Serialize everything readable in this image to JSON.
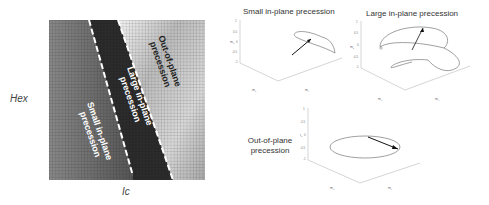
{
  "phase_diagram": {
    "y_axis_label": "Hex",
    "x_axis_label": "Ic",
    "regions": [
      {
        "label_line1": "Small in-plane",
        "label_line2": "precession"
      },
      {
        "label_line1": "Large in-plane",
        "label_line2": "precession"
      },
      {
        "label_line1": "Out-of-plane",
        "label_line2": "precession"
      }
    ],
    "colors": {
      "region_small": "#6a6a6a",
      "region_large": "#2a2a2a",
      "region_out_light": "#e8e8e8",
      "region_out_mid": "#9a9a9a",
      "boundary": "#ffffff"
    }
  },
  "trajectory_plots": [
    {
      "title": "Small in-plane precession",
      "axes": {
        "x": "m_x",
        "y": "m_y",
        "z": "m_z"
      },
      "ticks": [
        "-1",
        "-0.5",
        "0",
        "0.5",
        "1"
      ]
    },
    {
      "title": "Large in-plane precession",
      "axes": {
        "x": "m_x",
        "y": "m_y",
        "z": "m_z"
      },
      "ticks": [
        "-1",
        "-0.5",
        "0",
        "0.5",
        "1"
      ]
    },
    {
      "title_line1": "Out-of-plane",
      "title_line2": "precession",
      "axes": {
        "x": "m_x",
        "y": "m_y",
        "z": "m_z"
      },
      "ticks": [
        "-1",
        "-0.5",
        "0",
        "0.5",
        "1"
      ]
    }
  ]
}
